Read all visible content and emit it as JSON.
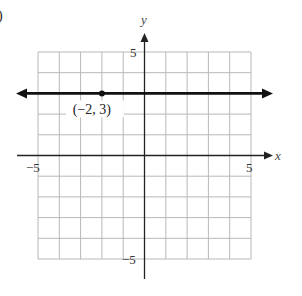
{
  "chart_data": {
    "type": "line",
    "title": "",
    "panel_label_fragment": ")",
    "xlabel": "x",
    "ylabel": "y",
    "xlim": [
      -5,
      5
    ],
    "ylim": [
      -5,
      5
    ],
    "grid": true,
    "grid_step": 1,
    "x_tick_labels": [
      "-5",
      "5"
    ],
    "y_tick_labels": [
      "5",
      "-5"
    ],
    "x_tick_label_text": [
      "−5",
      "5"
    ],
    "y_tick_label_text": [
      "5",
      "−5"
    ],
    "series": [
      {
        "name": "y = 3",
        "kind": "horizontal-line",
        "equation": "y = 3",
        "x": [
          -6,
          6
        ],
        "y": [
          3,
          3
        ],
        "arrows_both_ends": true
      }
    ],
    "points": [
      {
        "x": -2,
        "y": 3,
        "label": "(−2, 3)"
      }
    ]
  },
  "colors": {
    "grid": "#b8b8b8",
    "axis": "#222222",
    "line": "#111111",
    "background": "#ffffff"
  }
}
